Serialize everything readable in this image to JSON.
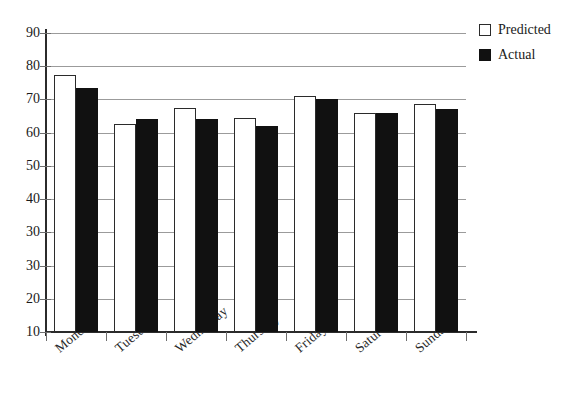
{
  "chart_data": {
    "type": "bar",
    "title": "",
    "xlabel": "",
    "ylabel": "",
    "ylim": [
      0,
      90
    ],
    "ytick_step": 10,
    "ytick_labels": [
      "90",
      "80",
      "70",
      "60",
      "50",
      "40",
      "30",
      "30",
      "20",
      "10",
      "0"
    ],
    "ytick_values": [
      90,
      80,
      70,
      60,
      50,
      40,
      30,
      20,
      10,
      0
    ],
    "grid": true,
    "legend_position": "top-right",
    "categories": [
      "Monday",
      "Tuesday",
      "Wednesday",
      "Thursday",
      "Friday",
      "Saturday",
      "Sunday"
    ],
    "series": [
      {
        "name": "Predicted",
        "color": "#ffffff",
        "values": [
          77.3,
          62.5,
          67.5,
          64.5,
          71.0,
          66.0,
          68.5
        ]
      },
      {
        "name": "Actual",
        "color": "#111111",
        "values": [
          73.5,
          64.0,
          64.0,
          62.0,
          70.0,
          66.0,
          67.0
        ]
      }
    ]
  },
  "legend": {
    "items": [
      {
        "label": "Predicted",
        "swatch": "hollow-square"
      },
      {
        "label": "Actual",
        "swatch": "filled-square"
      }
    ]
  },
  "title_fragment": ""
}
